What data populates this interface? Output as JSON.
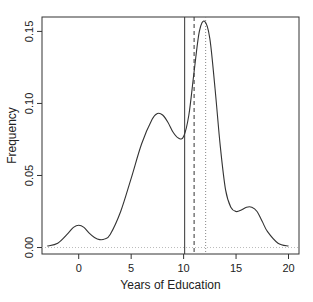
{
  "chart_data": {
    "type": "line",
    "title": "",
    "xlabel": "Years of Education",
    "ylabel": "Frequency",
    "xlim": [
      -3.5,
      21
    ],
    "ylim": [
      -0.0045,
      0.16
    ],
    "xticks": [
      0,
      5,
      10,
      15,
      20
    ],
    "xtick_labels": [
      "0",
      "5",
      "10",
      "15",
      "20"
    ],
    "yticks": [
      0.0,
      0.05,
      0.1,
      0.15
    ],
    "ytick_labels": [
      "0.00",
      "0.05",
      "0.10",
      "0.15"
    ],
    "grid": false,
    "legend": null,
    "series": [
      {
        "name": "density",
        "style": "solid",
        "x": [
          -3,
          -2,
          -1,
          -0.5,
          0,
          0.5,
          1,
          1.5,
          2,
          2.5,
          3,
          4,
          5,
          6,
          7,
          7.5,
          8,
          8.5,
          9,
          9.5,
          10,
          10.5,
          11,
          11.5,
          12,
          12.5,
          13,
          13.5,
          14,
          14.5,
          15,
          15.5,
          16,
          16.5,
          17,
          17.5,
          18,
          19,
          20
        ],
        "y": [
          0.001,
          0.003,
          0.01,
          0.014,
          0.0155,
          0.014,
          0.01,
          0.007,
          0.0055,
          0.006,
          0.009,
          0.025,
          0.048,
          0.072,
          0.089,
          0.093,
          0.092,
          0.087,
          0.08,
          0.076,
          0.077,
          0.092,
          0.122,
          0.15,
          0.157,
          0.145,
          0.11,
          0.07,
          0.04,
          0.028,
          0.025,
          0.026,
          0.028,
          0.028,
          0.025,
          0.018,
          0.011,
          0.003,
          0.001
        ]
      }
    ],
    "reference_lines": [
      {
        "name": "solid-vline",
        "x": 10.1,
        "style": "solid"
      },
      {
        "name": "dashed-vline",
        "x": 11.0,
        "style": "dashed"
      },
      {
        "name": "dotted-vline",
        "x": 12.1,
        "style": "dotted"
      }
    ],
    "zero_line": {
      "y": 0.0,
      "style": "dotted"
    }
  }
}
